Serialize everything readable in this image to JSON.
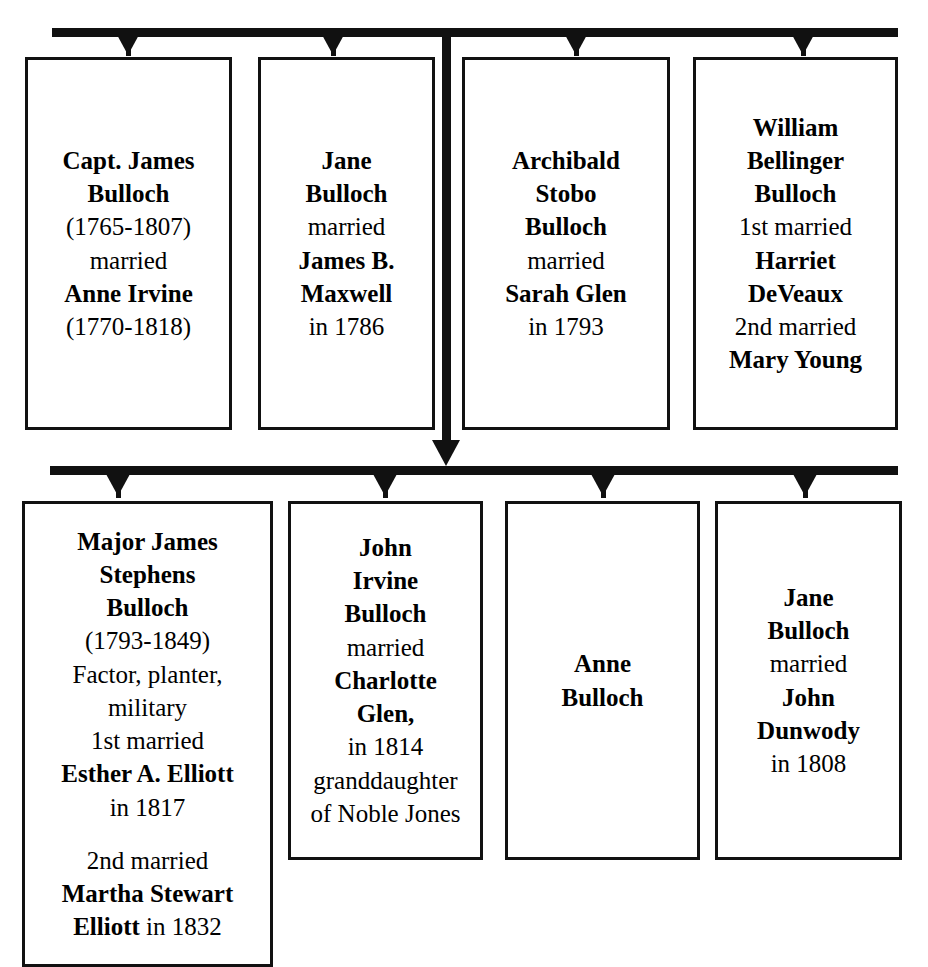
{
  "diagram": {
    "type": "family-tree",
    "title_partial": "",
    "generations": [
      {
        "id": "generation-1",
        "rail": {
          "x": 52,
          "y": 28,
          "width": 846
        },
        "boxes": [
          {
            "id": "capt-james-bulloch",
            "x": 25,
            "y": 57,
            "width": 207,
            "height": 373,
            "arrow_x": 128,
            "lines": [
              {
                "text": "Capt. James",
                "bold": true
              },
              {
                "text": "Bulloch",
                "bold": true
              },
              {
                "text": "(1765-1807)",
                "bold": false
              },
              {
                "text": "married",
                "bold": false
              },
              {
                "text": "Anne Irvine",
                "bold": true
              },
              {
                "text": "(1770-1818)",
                "bold": false
              }
            ]
          },
          {
            "id": "jane-bulloch-maxwell",
            "x": 258,
            "y": 57,
            "width": 177,
            "height": 373,
            "arrow_x": 333,
            "lines": [
              {
                "text": "Jane",
                "bold": true
              },
              {
                "text": "Bulloch",
                "bold": true
              },
              {
                "text": "married",
                "bold": false
              },
              {
                "text": "James B.",
                "bold": true
              },
              {
                "text": "Maxwell",
                "bold": true
              },
              {
                "text": "in 1786",
                "bold": false
              }
            ]
          },
          {
            "id": "archibald-stobo-bulloch",
            "x": 462,
            "y": 57,
            "width": 208,
            "height": 373,
            "arrow_x": 576,
            "lines": [
              {
                "text": "Archibald",
                "bold": true
              },
              {
                "text": "Stobo",
                "bold": true
              },
              {
                "text": "Bulloch",
                "bold": true
              },
              {
                "text": "married",
                "bold": false
              },
              {
                "text": "Sarah Glen",
                "bold": true
              },
              {
                "text": "in 1793",
                "bold": false
              }
            ]
          },
          {
            "id": "william-bellinger-bulloch",
            "x": 693,
            "y": 57,
            "width": 205,
            "height": 373,
            "arrow_x": 803,
            "lines": [
              {
                "text": "William",
                "bold": true
              },
              {
                "text": "Bellinger",
                "bold": true
              },
              {
                "text": "Bulloch",
                "bold": true
              },
              {
                "text": "1st married",
                "bold": false
              },
              {
                "text": "Harriet",
                "bold": true
              },
              {
                "text": "DeVeaux",
                "bold": true
              },
              {
                "text": "2nd married",
                "bold": false
              },
              {
                "text": "Mary Young",
                "bold": true
              }
            ]
          }
        ]
      },
      {
        "id": "generation-2",
        "rail": {
          "x": 50,
          "y": 466,
          "width": 848
        },
        "boxes": [
          {
            "id": "major-james-stephens-bulloch",
            "x": 22,
            "y": 501,
            "width": 251,
            "height": 466,
            "arrow_x": 118,
            "lines": [
              {
                "text": "Major James",
                "bold": true
              },
              {
                "text": "Stephens",
                "bold": true
              },
              {
                "text": "Bulloch",
                "bold": true
              },
              {
                "text": "(1793-1849)",
                "bold": false
              },
              {
                "text": "Factor, planter,",
                "bold": false
              },
              {
                "text": "military",
                "bold": false
              },
              {
                "text": "1st married",
                "bold": false
              },
              {
                "text": "Esther A. Elliott",
                "bold": true
              },
              {
                "text": "in 1817",
                "bold": false
              },
              {
                "text": "",
                "bold": false,
                "spacer": true
              },
              {
                "text": "2nd married",
                "bold": false
              },
              {
                "text": "Martha Stewart",
                "bold": true
              },
              {
                "text": "Elliott in 1832",
                "bold": true,
                "mixed": [
                  {
                    "text": "Elliott",
                    "bold": true
                  },
                  {
                    "text": " in 1832",
                    "bold": false
                  }
                ]
              }
            ]
          },
          {
            "id": "john-irvine-bulloch",
            "x": 288,
            "y": 501,
            "width": 195,
            "height": 359,
            "arrow_x": 385,
            "lines": [
              {
                "text": "John",
                "bold": true
              },
              {
                "text": "Irvine",
                "bold": true
              },
              {
                "text": "Bulloch",
                "bold": true
              },
              {
                "text": "married",
                "bold": false
              },
              {
                "text": "Charlotte",
                "bold": true
              },
              {
                "text": "Glen,",
                "bold": true
              },
              {
                "text": "in 1814",
                "bold": false
              },
              {
                "text": "granddaughter",
                "bold": false
              },
              {
                "text": "of Noble Jones",
                "bold": false
              }
            ]
          },
          {
            "id": "anne-bulloch",
            "x": 505,
            "y": 501,
            "width": 195,
            "height": 359,
            "arrow_x": 603,
            "lines": [
              {
                "text": "Anne",
                "bold": true
              },
              {
                "text": "Bulloch",
                "bold": true
              }
            ]
          },
          {
            "id": "jane-bulloch-dunwody",
            "x": 715,
            "y": 501,
            "width": 187,
            "height": 359,
            "arrow_x": 805,
            "lines": [
              {
                "text": "Jane",
                "bold": true
              },
              {
                "text": "Bulloch",
                "bold": true
              },
              {
                "text": "married",
                "bold": false
              },
              {
                "text": "John",
                "bold": true
              },
              {
                "text": "Dunwody",
                "bold": true
              },
              {
                "text": "in 1808",
                "bold": false
              }
            ]
          }
        ]
      }
    ],
    "spine": {
      "x": 442,
      "y_top": 28,
      "y_bottom": 466
    },
    "colors": {
      "line": "#111111",
      "text": "#000000",
      "background": "#ffffff"
    }
  }
}
